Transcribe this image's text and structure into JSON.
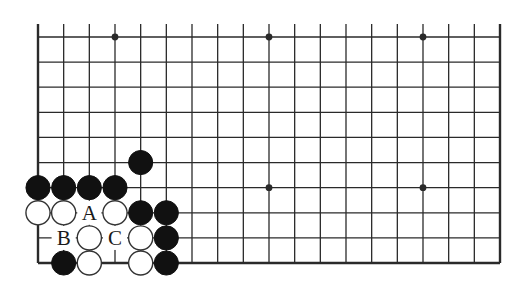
{
  "diagram": {
    "type": "go-board-partial",
    "columns": 19,
    "rows_shown": 10,
    "edges": {
      "left": true,
      "right": true,
      "bottom": true,
      "top": false
    },
    "grid": {
      "x0": 38,
      "x1": 500,
      "y_top": 37,
      "y_bottom": 263,
      "top_extension": 13
    },
    "colors": {
      "line": "#2a2a2a",
      "black_stone": "#111111",
      "white_stone": "#ffffff",
      "background": "#ffffff"
    },
    "star_points": [
      {
        "col": 4,
        "row": 10
      },
      {
        "col": 10,
        "row": 10
      },
      {
        "col": 16,
        "row": 10
      },
      {
        "col": 10,
        "row": 4
      },
      {
        "col": 16,
        "row": 4
      }
    ],
    "stones": [
      {
        "color": "black",
        "col": 5,
        "row": 5
      },
      {
        "color": "black",
        "col": 1,
        "row": 4
      },
      {
        "color": "black",
        "col": 2,
        "row": 4
      },
      {
        "color": "black",
        "col": 3,
        "row": 4
      },
      {
        "color": "black",
        "col": 4,
        "row": 4
      },
      {
        "color": "white",
        "col": 1,
        "row": 3
      },
      {
        "color": "white",
        "col": 2,
        "row": 3
      },
      {
        "color": "white",
        "col": 4,
        "row": 3
      },
      {
        "color": "black",
        "col": 5,
        "row": 3
      },
      {
        "color": "black",
        "col": 6,
        "row": 3
      },
      {
        "color": "white",
        "col": 3,
        "row": 2
      },
      {
        "color": "white",
        "col": 5,
        "row": 2
      },
      {
        "color": "black",
        "col": 6,
        "row": 2
      },
      {
        "color": "black",
        "col": 2,
        "row": 1
      },
      {
        "color": "white",
        "col": 3,
        "row": 1
      },
      {
        "color": "white",
        "col": 5,
        "row": 1
      },
      {
        "color": "black",
        "col": 6,
        "row": 1
      }
    ],
    "labels": [
      {
        "text": "A",
        "col": 3,
        "row": 3
      },
      {
        "text": "B",
        "col": 2,
        "row": 2
      },
      {
        "text": "C",
        "col": 4,
        "row": 2
      }
    ]
  }
}
